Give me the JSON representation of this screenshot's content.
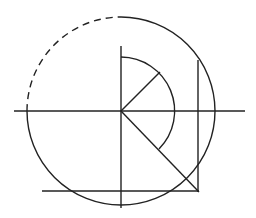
{
  "diagram": {
    "width": 256,
    "height": 218,
    "stroke_color": "#222222",
    "background": "#ffffff",
    "center": {
      "x": 121,
      "y": 111
    },
    "big_circle": {
      "r": 94,
      "dashed_arc": "upper-left quadrant"
    },
    "small_arc": {
      "r": 54,
      "from_deg": -90,
      "to_deg": 45
    },
    "labels": []
  }
}
